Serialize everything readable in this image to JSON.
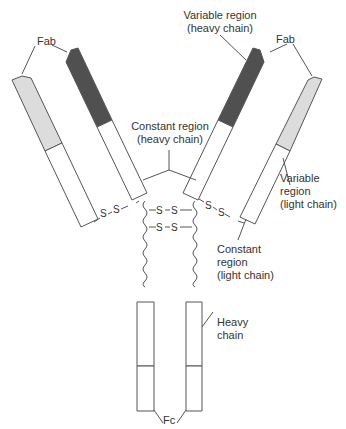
{
  "diagram": {
    "type": "antibody-structure",
    "colors": {
      "heavy_variable": "#505050",
      "light_variable": "#dcdcdc",
      "constant": "#ffffff",
      "stroke": "#555555",
      "text": "#333333"
    },
    "bond_label": "S",
    "labels": {
      "fab_left": "Fab",
      "fab_right": "Fab",
      "variable_heavy_line1": "Variable region",
      "variable_heavy_line2": "(heavy chain)",
      "constant_heavy_line1": "Constant region",
      "constant_heavy_line2": "(heavy chain)",
      "variable_light_line1": "Variable",
      "variable_light_line2": "region",
      "variable_light_line3": "(light chain)",
      "constant_light_line1": "Constant",
      "constant_light_line2": "region",
      "constant_light_line3": "(light chain)",
      "heavy_chain_line1": "Heavy",
      "heavy_chain_line2": "chain",
      "fc": "Fc"
    },
    "disulfide_bonds": [
      {
        "between": "left light chain – left heavy chain",
        "atoms": [
          "S",
          "S"
        ]
      },
      {
        "between": "right heavy chain – right light chain",
        "atoms": [
          "S",
          "S"
        ]
      },
      {
        "between": "hinge heavy–heavy (upper)",
        "atoms": [
          "S",
          "S"
        ]
      },
      {
        "between": "hinge heavy–heavy (lower)",
        "atoms": [
          "S",
          "S"
        ]
      }
    ]
  }
}
